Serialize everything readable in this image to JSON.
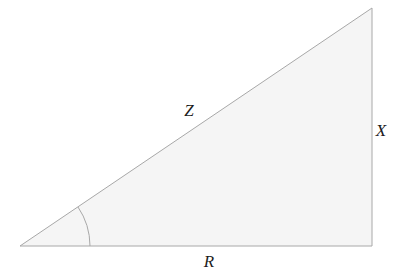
{
  "figure": {
    "kind": "right-triangle-diagram",
    "background_color": "#ffffff",
    "fill_color": "#f5f5f5",
    "stroke_color": "#a8a8a8",
    "stroke_width": 1,
    "label_color": "#1c1c1c"
  },
  "labels": {
    "hypotenuse": "Z",
    "vertical_leg": "X",
    "horizontal_leg": "R"
  },
  "geometry": {
    "vertices": {
      "left": [
        20,
        246
      ],
      "bottom_right": [
        372,
        246
      ],
      "apex": [
        372,
        8
      ]
    },
    "angle_arc": {
      "center": [
        20,
        246
      ],
      "radius": 70,
      "start_point": [
        90,
        246
      ],
      "end_point": [
        78,
        207
      ],
      "degrees": 34
    },
    "label_positions": {
      "hypotenuse": [
        189,
        110
      ],
      "vertical_leg": [
        381,
        130
      ],
      "horizontal_leg": [
        209,
        261
      ]
    }
  }
}
